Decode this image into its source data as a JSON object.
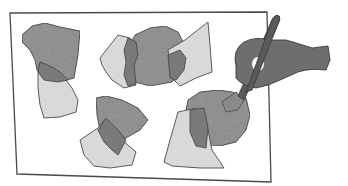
{
  "illustration": {
    "description": "Pencil sketch of a sheet of paper with four collage groups of overlapping shapes; a hand holds a paintbrush applying paint/glue to the lower-right shape.",
    "colors": {
      "paper": "#ffffff",
      "outline": "#4a4a4a",
      "light_shape": "#d9d9d9",
      "textured_shape": "#9a9a9a",
      "overlap_shape": "#7a7a7a",
      "hand": "#6e6e6e",
      "brush_handle": "#5a5a5a"
    },
    "groups": [
      {
        "id": "top-left",
        "shapes": [
          "textured blob",
          "light blob",
          "dark overlap"
        ]
      },
      {
        "id": "top-center",
        "shapes": [
          "textured round blob",
          "light left polygon",
          "light right polygon",
          "dark overlaps"
        ]
      },
      {
        "id": "bottom-center",
        "shapes": [
          "textured fan",
          "light polygon",
          "dark overlap"
        ]
      },
      {
        "id": "bottom-right",
        "shapes": [
          "textured blob",
          "light trapezoid",
          "dark overlap"
        ]
      }
    ],
    "tool": "paintbrush",
    "hand": "right hand holding brush"
  }
}
